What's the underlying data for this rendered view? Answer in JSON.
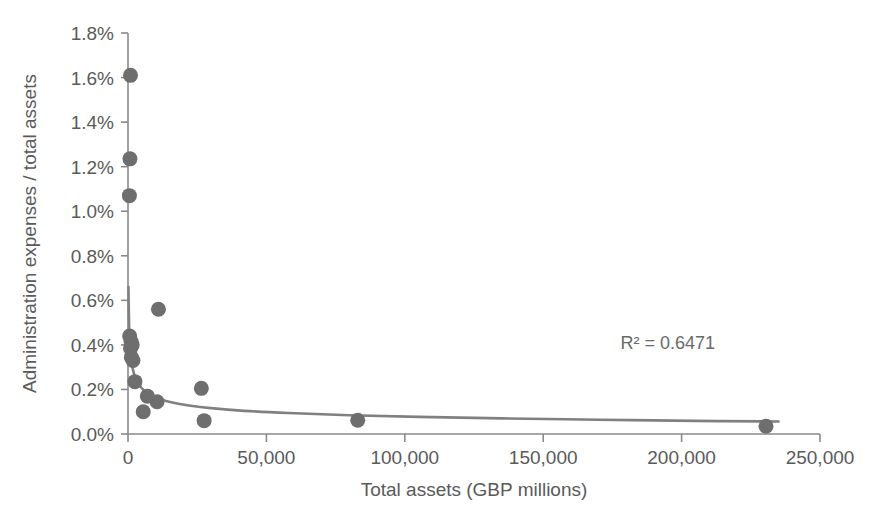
{
  "chart_data": {
    "type": "scatter",
    "title": "",
    "xlabel": "Total assets (GBP millions)",
    "ylabel": "Administration expenses / total assets",
    "xlim": [
      0,
      250000
    ],
    "ylim": [
      0,
      0.018
    ],
    "grid": false,
    "legend": false,
    "x_tick_labels": [
      "0",
      "50,000",
      "100,000",
      "150,000",
      "200,000",
      "250,000"
    ],
    "x_tick_values": [
      0,
      50000,
      100000,
      150000,
      200000,
      250000
    ],
    "y_tick_labels": [
      "0.0%",
      "0.2%",
      "0.4%",
      "0.6%",
      "0.8%",
      "1.0%",
      "1.2%",
      "1.4%",
      "1.6%",
      "1.8%"
    ],
    "y_tick_values": [
      0.0,
      0.002,
      0.004,
      0.006,
      0.008,
      0.01,
      0.012,
      0.014,
      0.016,
      0.018
    ],
    "annotations": [
      {
        "text": "R² = 0.6471",
        "x": 195000,
        "y": 0.0038
      }
    ],
    "series": [
      {
        "name": "Banks",
        "marker": "circle",
        "color": "#6e6e6e",
        "points": [
          {
            "x": 900,
            "y": 0.0161
          },
          {
            "x": 700,
            "y": 0.01235
          },
          {
            "x": 500,
            "y": 0.0107
          },
          {
            "x": 11000,
            "y": 0.0056
          },
          {
            "x": 600,
            "y": 0.0044
          },
          {
            "x": 1100,
            "y": 0.00415
          },
          {
            "x": 1500,
            "y": 0.004
          },
          {
            "x": 900,
            "y": 0.00385
          },
          {
            "x": 1200,
            "y": 0.00345
          },
          {
            "x": 1800,
            "y": 0.0033
          },
          {
            "x": 2500,
            "y": 0.00235
          },
          {
            "x": 26500,
            "y": 0.00205
          },
          {
            "x": 7000,
            "y": 0.0017
          },
          {
            "x": 10500,
            "y": 0.00145
          },
          {
            "x": 5500,
            "y": 0.001
          },
          {
            "x": 27500,
            "y": 0.0006
          },
          {
            "x": 83000,
            "y": 0.00062
          },
          {
            "x": 230500,
            "y": 0.00035
          }
        ]
      }
    ],
    "trendline": {
      "name": "power-fit",
      "type": "power",
      "color": "#808080",
      "r_squared": 0.6471,
      "r_squared_label": "R² = 0.6471",
      "points": [
        {
          "x": 180,
          "y": 0.0066
        },
        {
          "x": 300,
          "y": 0.00545
        },
        {
          "x": 500,
          "y": 0.0045
        },
        {
          "x": 800,
          "y": 0.0038
        },
        {
          "x": 1200,
          "y": 0.0033
        },
        {
          "x": 1800,
          "y": 0.00288
        },
        {
          "x": 2600,
          "y": 0.00255
        },
        {
          "x": 3800,
          "y": 0.00225
        },
        {
          "x": 5500,
          "y": 0.00199
        },
        {
          "x": 8000,
          "y": 0.00176
        },
        {
          "x": 11500,
          "y": 0.00157
        },
        {
          "x": 16000,
          "y": 0.00141
        },
        {
          "x": 22000,
          "y": 0.00128
        },
        {
          "x": 30000,
          "y": 0.00116
        },
        {
          "x": 42000,
          "y": 0.00104
        },
        {
          "x": 58000,
          "y": 0.00094
        },
        {
          "x": 80000,
          "y": 0.00084
        },
        {
          "x": 105000,
          "y": 0.00077
        },
        {
          "x": 135000,
          "y": 0.0007
        },
        {
          "x": 170000,
          "y": 0.00064
        },
        {
          "x": 205000,
          "y": 0.00059
        },
        {
          "x": 235000,
          "y": 0.00056
        }
      ]
    }
  }
}
